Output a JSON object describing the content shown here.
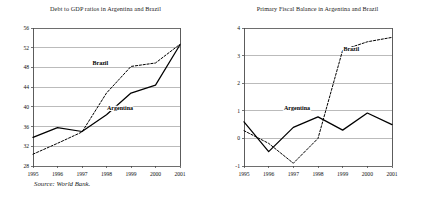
{
  "figure": {
    "source_note": "Source: World Bank.",
    "background": "#ffffff",
    "line_color": "#000000"
  },
  "chart_data": [
    {
      "id": "debt-to-gdp",
      "type": "line",
      "title": "Debt to GDP ratios in Argentina and Brazil",
      "xlabel": "",
      "ylabel": "",
      "x": [
        1995,
        1996,
        1997,
        1998,
        1999,
        2000,
        2001
      ],
      "xtick_labels": [
        "1995",
        "1996",
        "1997",
        "1998",
        "1999",
        "2000",
        "2001"
      ],
      "ytick_labels": [
        "28",
        "32",
        "36",
        "40",
        "44",
        "48",
        "52",
        "56"
      ],
      "yticks": [
        28,
        32,
        36,
        40,
        44,
        48,
        52,
        56
      ],
      "ylim": [
        28,
        56
      ],
      "xlim": [
        1995,
        2001
      ],
      "grid": true,
      "legend": "inline-labels",
      "series": [
        {
          "name": "Argentina",
          "style": "solid",
          "label_x": 1998.55,
          "label_y": 39.3,
          "values": [
            33.8,
            35.8,
            35.0,
            38.4,
            42.8,
            44.4,
            52.6
          ]
        },
        {
          "name": "Brazil",
          "style": "dashed",
          "label_x": 1997.75,
          "label_y": 48.4,
          "values": [
            30.4,
            32.6,
            34.9,
            42.8,
            48.2,
            48.9,
            52.7
          ]
        }
      ]
    },
    {
      "id": "primary-fiscal-balance",
      "type": "line",
      "title": "Primary Fiscal Balance in Argentina and Brazil",
      "xlabel": "",
      "ylabel": "",
      "x": [
        1995,
        1996,
        1997,
        1998,
        1999,
        2000,
        2001
      ],
      "xtick_labels": [
        "1995",
        "1996",
        "1997",
        "1998",
        "1999",
        "2000",
        "2001"
      ],
      "ytick_labels": [
        "-1",
        "0",
        "1",
        "2",
        "3",
        "4"
      ],
      "yticks": [
        -1,
        0,
        1,
        2,
        3,
        4
      ],
      "ylim": [
        -1,
        4
      ],
      "xlim": [
        1995,
        2001
      ],
      "grid": true,
      "legend": "inline-labels",
      "series": [
        {
          "name": "Argentina",
          "style": "solid",
          "label_x": 1997.15,
          "label_y": 1.02,
          "values": [
            0.6,
            -0.48,
            0.4,
            0.78,
            0.3,
            0.92,
            0.5
          ]
        },
        {
          "name": "Brazil",
          "style": "dashed",
          "label_x": 1999.35,
          "label_y": 3.18,
          "values": [
            0.28,
            -0.18,
            -0.9,
            0.0,
            3.2,
            3.5,
            3.66
          ]
        }
      ]
    }
  ]
}
